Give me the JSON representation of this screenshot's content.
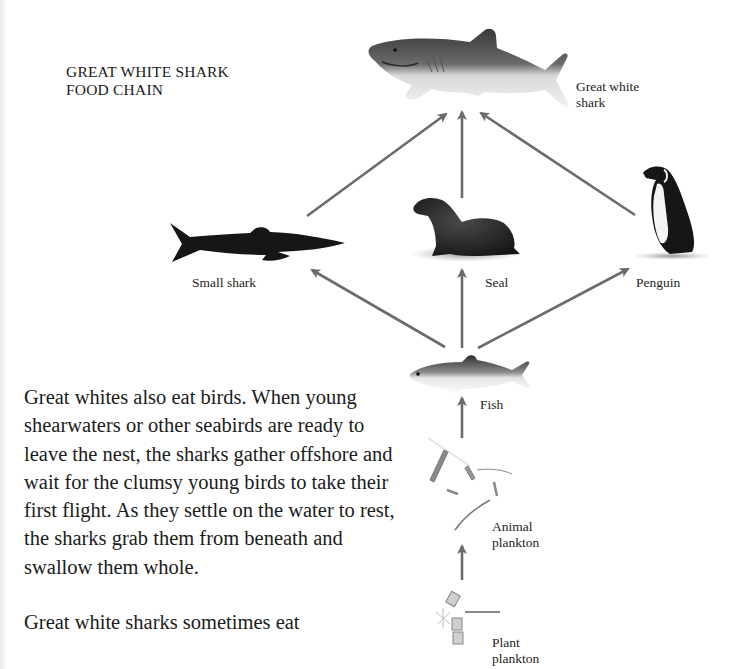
{
  "title": {
    "line1": "GREAT WHITE SHARK",
    "line2": "FOOD CHAIN"
  },
  "nodes": {
    "great_white_shark": {
      "label_line1": "Great white",
      "label_line2": "shark",
      "icon": "great-white-shark-icon"
    },
    "small_shark": {
      "label": "Small shark",
      "icon": "small-shark-icon"
    },
    "seal": {
      "label": "Seal",
      "icon": "seal-icon"
    },
    "penguin": {
      "label": "Penguin",
      "icon": "penguin-icon"
    },
    "fish": {
      "label": "Fish",
      "icon": "fish-icon"
    },
    "animal_plankton": {
      "label_line1": "Animal",
      "label_line2": "plankton",
      "icon": "animal-plankton-icon"
    },
    "plant_plankton": {
      "label_line1": "Plant",
      "label_line2": "plankton",
      "icon": "plant-plankton-icon"
    }
  },
  "edges": [
    {
      "from": "Small shark",
      "to": "Great white shark"
    },
    {
      "from": "Seal",
      "to": "Great white shark"
    },
    {
      "from": "Penguin",
      "to": "Great white shark"
    },
    {
      "from": "Fish",
      "to": "Small shark"
    },
    {
      "from": "Fish",
      "to": "Seal"
    },
    {
      "from": "Fish",
      "to": "Penguin"
    },
    {
      "from": "Animal plankton",
      "to": "Fish"
    },
    {
      "from": "Plant plankton",
      "to": "Animal plankton"
    }
  ],
  "body": {
    "paragraph1": "Great whites also eat birds. When young shearwaters or other seabirds are ready to leave the nest, the sharks gather offshore and wait for the clumsy young birds to take their first flight. As they settle on the water to rest, the sharks grab them from beneath and swallow them whole.",
    "paragraph2": "Great white sharks sometimes eat"
  },
  "colors": {
    "arrow": "#6b6b6b",
    "text": "#1c1c1c",
    "background": "#ffffff"
  }
}
